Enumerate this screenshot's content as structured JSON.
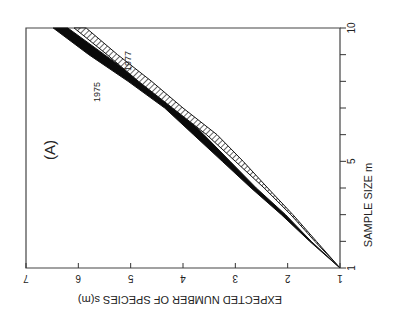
{
  "chart_data": {
    "type": "area",
    "orientation": "rotated-90-clockwise",
    "panel_label": "(A)",
    "title": "",
    "xlabel": "SAMPLE SIZE m",
    "ylabel": "EXPECTED NUMBER OF SPECIES s(m)",
    "xlim": [
      1,
      10
    ],
    "ylim": [
      1,
      7
    ],
    "x_ticks": [
      1,
      2,
      3,
      4,
      5,
      6,
      7,
      8,
      9,
      10
    ],
    "x_tick_labels": [
      "1",
      "",
      "",
      "",
      "5",
      "",
      "",
      "",
      "",
      "10"
    ],
    "y_ticks": [
      1,
      2,
      3,
      4,
      5,
      6,
      7
    ],
    "y_tick_labels": [
      "1",
      "2",
      "3",
      "4",
      "5",
      "6",
      "7"
    ],
    "grid": false,
    "legend": "inline labels",
    "series": [
      {
        "name": "1975",
        "style": "solid black band",
        "x": [
          1,
          2,
          3,
          4,
          5,
          6,
          7,
          8,
          9,
          10
        ],
        "lower": [
          1,
          1.55,
          2.04,
          2.6,
          3.1,
          3.6,
          4.1,
          4.8,
          5.5,
          6.2
        ],
        "upper": [
          1,
          1.58,
          2.12,
          2.7,
          3.25,
          3.8,
          4.35,
          5.05,
          5.8,
          6.48
        ]
      },
      {
        "name": "1977",
        "style": "hatched band",
        "x": [
          1,
          2,
          3,
          4,
          5,
          6,
          7,
          8,
          9,
          10
        ],
        "lower": [
          1,
          1.45,
          1.9,
          2.38,
          2.85,
          3.35,
          4.0,
          4.6,
          5.25,
          5.85
        ],
        "upper": [
          1,
          1.48,
          1.94,
          2.45,
          3.0,
          3.55,
          4.2,
          4.85,
          5.45,
          6.08
        ]
      }
    ],
    "annotations": [
      {
        "text": "1975",
        "near_series": "1975"
      },
      {
        "text": "1977",
        "near_series": "1977"
      }
    ]
  }
}
